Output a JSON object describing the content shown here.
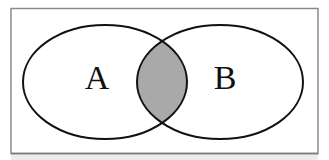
{
  "diagram": {
    "type": "venn",
    "sets": [
      {
        "id": "A",
        "label": "A"
      },
      {
        "id": "B",
        "label": "B"
      }
    ],
    "shaded_region": "A ∩ B",
    "colors": {
      "frame": "#8a8a8a",
      "outline": "#111111",
      "shade": "#a9a9a9",
      "background": "#ffffff",
      "bottom_band": "#ececec"
    }
  }
}
